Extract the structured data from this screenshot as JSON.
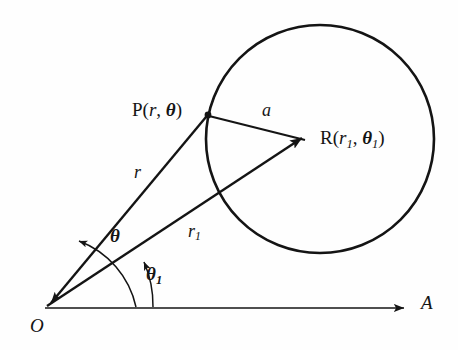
{
  "figure": {
    "background_color": "#fefefe",
    "stroke_color": "#141414",
    "points": {
      "origin": {
        "label": "O",
        "x": 45,
        "y": 308
      },
      "p": {
        "label_prefix": "P(",
        "label_var1": "r",
        "label_sep": ", ",
        "label_var2": "θ",
        "label_suffix": ")",
        "full_label": "P(r, θ)",
        "x": 208,
        "y": 115
      },
      "r_center": {
        "label_prefix": "R(",
        "label_var1": "r",
        "label_sub1": "1",
        "label_sep": ", ",
        "label_var2": "θ",
        "label_sub2": "1",
        "label_suffix": ")",
        "full_label": "R(r₁, θ₁)",
        "x": 312,
        "y": 141
      },
      "axis_tip": {
        "label": "A",
        "x": 412,
        "y": 308
      }
    },
    "segments": {
      "r": {
        "label": "r",
        "from": "O",
        "to": "P"
      },
      "r1": {
        "label_var": "r",
        "label_sub": "1",
        "full_label": "r₁",
        "from": "O",
        "to": "R"
      },
      "a": {
        "label": "a",
        "from": "P",
        "to": "R"
      },
      "polar_axis": {
        "label": "A",
        "from": "O",
        "to": "axis_tip"
      }
    },
    "angles": {
      "theta": {
        "label": "θ",
        "between": "r1 and r",
        "vertex": "O"
      },
      "theta1": {
        "label_var": "θ",
        "label_sub": "1",
        "full_label": "θ₁",
        "between": "polar axis and r1",
        "vertex": "O"
      }
    },
    "circle": {
      "center_point": "R",
      "radius_label": "a",
      "cx": 320,
      "cy": 139,
      "r": 114
    }
  }
}
